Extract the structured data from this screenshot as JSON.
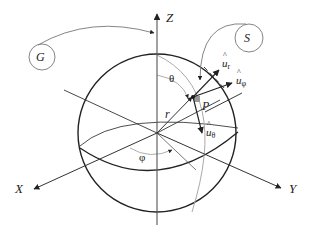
{
  "diagram": {
    "axes": {
      "x_label": "X",
      "y_label": "Y",
      "z_label": "Z"
    },
    "point_label": "P",
    "radius_label": "r",
    "angles": {
      "polar_label": "θ",
      "azimuth_label": "φ"
    },
    "unit_vectors": [
      {
        "base": "u",
        "sub": "r"
      },
      {
        "base": "u",
        "sub": "φ"
      },
      {
        "base": "u",
        "sub": "θ"
      }
    ],
    "callouts": {
      "g_label": "G",
      "s_label": "S"
    },
    "colors": {
      "line": "#222222",
      "thin_line": "#555555",
      "light_line": "#aaaaaa",
      "marker_fill": "#999999",
      "background": "#ffffff"
    }
  }
}
